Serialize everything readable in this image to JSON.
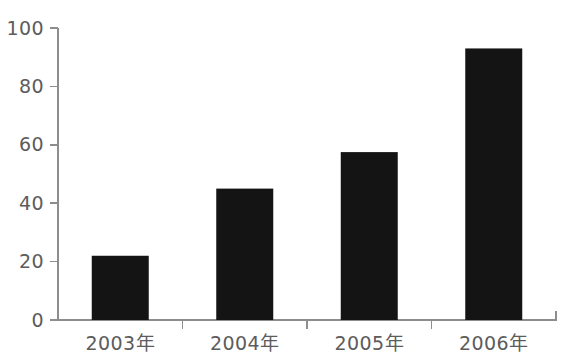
{
  "chart_data": {
    "type": "bar",
    "title": "",
    "subtitle": "",
    "xlabel": "",
    "ylabel": "",
    "categories": [
      "2003年",
      "2004年",
      "2005年",
      "2006年"
    ],
    "values": [
      22,
      45,
      57.5,
      93
    ],
    "series": [
      {
        "name": "",
        "values": [
          22,
          45,
          57.5,
          93
        ]
      }
    ],
    "ylim": [
      0,
      100
    ],
    "yticks": [
      0,
      20,
      40,
      60,
      80,
      100
    ],
    "ytick_labels": [
      "0",
      "20",
      "40",
      "60",
      "80",
      "100"
    ],
    "grid": false,
    "legend": false,
    "legend_position": "none",
    "annotations": [],
    "bar_color": "#141414",
    "axis_color": "#8d8d8d",
    "label_color": "#5c5c5c",
    "background_color": "#ffffff"
  }
}
